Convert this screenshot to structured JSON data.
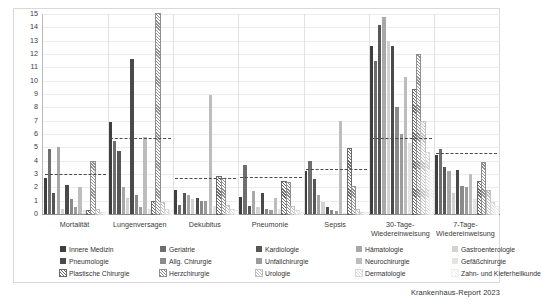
{
  "footer": {
    "source": "Krankenhaus-Report 2023"
  },
  "axis": {
    "y_ticks": [
      0,
      1,
      2,
      3,
      4,
      5,
      6,
      7,
      8,
      9,
      10,
      11,
      12,
      13,
      14,
      15
    ],
    "ylim": [
      0,
      15
    ]
  },
  "legend": {
    "items": [
      {
        "label": "Innere Medizin",
        "color": "#3f3f3f",
        "pattern": "solid"
      },
      {
        "label": "Geriatrie",
        "color": "#6e6e6e",
        "pattern": "solid"
      },
      {
        "label": "Kardiologie",
        "color": "#565656",
        "pattern": "solid"
      },
      {
        "label": "Hämatologie",
        "color": "#a8a8a8",
        "pattern": "solid"
      },
      {
        "label": "Gastroenterologie",
        "color": "#d2d2d2",
        "pattern": "solid"
      },
      {
        "label": "Pneumologie",
        "color": "#4a4a4a",
        "pattern": "solid"
      },
      {
        "label": "Allg. Chirurgie",
        "color": "#8a8a8a",
        "pattern": "solid"
      },
      {
        "label": "Unfallchirurgie",
        "color": "#9c9c9c",
        "pattern": "solid"
      },
      {
        "label": "Neurochirurgie",
        "color": "#bdbdbd",
        "pattern": "solid"
      },
      {
        "label": "Gefäßchirurgie",
        "color": "#e4e4e4",
        "pattern": "solid"
      },
      {
        "label": "Plastische Chirurgie",
        "color": "#6a6a6a",
        "pattern": "hatch"
      },
      {
        "label": "Herzchirurgie",
        "color": "#8f8f8f",
        "pattern": "hatch"
      },
      {
        "label": "Urologie",
        "color": "#c0c0c0",
        "pattern": "hatch"
      },
      {
        "label": "Dermatologie",
        "color": "#d8d8d8",
        "pattern": "hatch"
      },
      {
        "label": "Zahn- und Kieferheilkunde",
        "color": "#eeeeee",
        "pattern": "hatch"
      }
    ]
  },
  "chart_data": {
    "type": "bar",
    "title": "",
    "xlabel": "",
    "ylabel": "",
    "ylim": [
      0,
      15
    ],
    "grid": true,
    "legend_position": "bottom",
    "categories": [
      "Mortalität",
      "Lungenversagen",
      "Dekubitus",
      "Pneumonie",
      "Sepsis",
      "30-Tage-Wiedereinweisung",
      "7-Tage-Wiedereinweisung"
    ],
    "series": [
      {
        "name": "Innere Medizin",
        "values": [
          2.7,
          6.9,
          1.8,
          1.3,
          3.2,
          12.6,
          4.4
        ]
      },
      {
        "name": "Geriatrie",
        "values": [
          4.9,
          5.5,
          0.7,
          3.7,
          4.0,
          11.5,
          4.9
        ]
      },
      {
        "name": "Kardiologie",
        "values": [
          1.6,
          4.7,
          1.6,
          0.6,
          2.6,
          14.2,
          3.5
        ]
      },
      {
        "name": "Hämatologie",
        "values": [
          5.0,
          2.0,
          1.4,
          1.7,
          1.4,
          14.8,
          3.2
        ]
      },
      {
        "name": "Gastroenterologie",
        "values": [
          0.4,
          1.2,
          1.1,
          0.5,
          0.9,
          13.0,
          1.6
        ]
      },
      {
        "name": "Pneumologie",
        "values": [
          2.2,
          11.6,
          1.2,
          1.6,
          0.5,
          12.6,
          3.3
        ]
      },
      {
        "name": "Allg. Chirurgie",
        "values": [
          1.1,
          1.4,
          1.0,
          0.4,
          0.3,
          8.0,
          2.1
        ]
      },
      {
        "name": "Unfallchirurgie",
        "values": [
          0.5,
          0.5,
          1.0,
          0.3,
          0.2,
          6.0,
          2.0
        ]
      },
      {
        "name": "Neurochirurgie",
        "values": [
          2.0,
          5.8,
          8.9,
          1.2,
          7.0,
          10.3,
          3.0
        ]
      },
      {
        "name": "Gefäßchirurgie",
        "values": [
          0.3,
          0.4,
          0.6,
          0.4,
          0.1,
          5.3,
          1.1
        ]
      },
      {
        "name": "Plastische Chirurgie",
        "values": [
          0.2,
          0.9,
          2.8,
          2.4,
          4.9,
          9.3,
          2.4
        ]
      },
      {
        "name": "Herzchirurgie",
        "values": [
          3.9,
          15.0,
          2.6,
          2.3,
          2.0,
          11.9,
          3.8
        ]
      },
      {
        "name": "Urologie",
        "values": [
          0.3,
          0.8,
          0.6,
          0.5,
          0.3,
          6.9,
          1.7
        ]
      },
      {
        "name": "Dermatologie",
        "values": [
          0.1,
          0.3,
          0.3,
          0.2,
          0.1,
          4.6,
          0.8
        ]
      },
      {
        "name": "Zahn- und Kieferheilkunde",
        "values": [
          0.1,
          0.2,
          0.2,
          0.1,
          0.1,
          3.2,
          0.5
        ]
      }
    ],
    "reference_lines": {
      "name": "Durchschnitt",
      "style": "dashed",
      "values": [
        3.0,
        5.7,
        2.7,
        2.8,
        3.4,
        5.7,
        4.6
      ]
    }
  }
}
